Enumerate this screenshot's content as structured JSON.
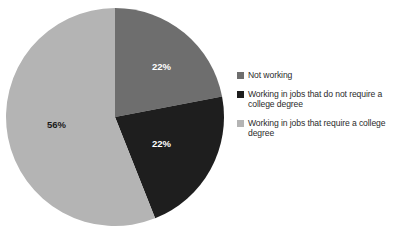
{
  "chart_data": {
    "type": "pie",
    "title": "",
    "subtitle": "",
    "legend_position": "right",
    "grid": false,
    "categories": [
      "Not working",
      "Working in jobs that do not require a college degree",
      "Working in jobs that require a college degree"
    ],
    "values": [
      22,
      22,
      56
    ],
    "value_labels": [
      "22%",
      "22%",
      "56%"
    ],
    "colors": [
      "#6e6e6e",
      "#1e1e1e",
      "#b4b4b4"
    ],
    "label_colors": [
      "#ffffff",
      "#ffffff",
      "#1a1a1a"
    ],
    "start_angle_deg": 0,
    "direction": "clockwise",
    "slices": [
      {
        "name": "Not working",
        "percent": 22,
        "label": "22%",
        "color": "#6e6e6e",
        "start_deg": 0,
        "end_deg": 79.2
      },
      {
        "name": "Working in jobs that do not require a college degree",
        "percent": 22,
        "label": "22%",
        "color": "#1e1e1e",
        "start_deg": 79.2,
        "end_deg": 158.4
      },
      {
        "name": "Working in jobs that require a college degree",
        "percent": 56,
        "label": "56%",
        "color": "#b4b4b4",
        "start_deg": 158.4,
        "end_deg": 360
      }
    ],
    "xlabel": "",
    "ylabel": ""
  },
  "legend": {
    "items": [
      {
        "label": "Not working",
        "color": "#6e6e6e"
      },
      {
        "label": "Working in jobs that do not require a college degree",
        "color": "#1e1e1e"
      },
      {
        "label": "Working in jobs that require a college degree",
        "color": "#b4b4b4"
      }
    ]
  },
  "colors": {
    "background": "#ffffff",
    "text": "#2b2b2b",
    "slice_not_working": "#6e6e6e",
    "slice_no_degree": "#1e1e1e",
    "slice_degree": "#b4b4b4"
  }
}
